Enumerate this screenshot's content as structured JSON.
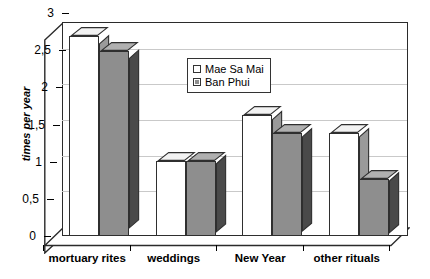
{
  "chart_data": {
    "type": "bar",
    "title": "",
    "subtitle": "",
    "xlabel": "",
    "ylabel": "times per year",
    "categories": [
      "mortuary rites",
      "weddings",
      "New Year",
      "other rituals"
    ],
    "series": [
      {
        "name": "Mae Sa Mai",
        "values": [
          2.8,
          1.05,
          1.7,
          1.45
        ],
        "color": "#ffffff"
      },
      {
        "name": "Ban Phui",
        "values": [
          2.6,
          1.05,
          1.45,
          0.8
        ],
        "color": "#8e8e8e"
      }
    ],
    "ylim": [
      0,
      3
    ],
    "ytick_values": [
      0,
      0.5,
      1,
      1.5,
      2,
      2.5,
      3
    ],
    "ytick_labels": [
      "0",
      "0,5",
      "1",
      "1,5",
      "2",
      "2,5",
      "3"
    ],
    "decimal_separator": ",",
    "grid": true,
    "grid_axis": "y",
    "grid_color": "#c9c9c9",
    "legend_position": "upper center",
    "three_d": true,
    "background_color": "#ffffff",
    "axis_color": "#2b2b2b"
  },
  "axis": {
    "y_title": "times per year",
    "ticks": [
      {
        "label": "3",
        "value": 3
      },
      {
        "label": "2,5",
        "value": 2.5
      },
      {
        "label": "2",
        "value": 2
      },
      {
        "label": "1,5",
        "value": 1.5
      },
      {
        "label": "1",
        "value": 1
      },
      {
        "label": "0,5",
        "value": 0.5
      },
      {
        "label": "0",
        "value": 0
      }
    ]
  },
  "categories": [
    {
      "label": "mortuary rites"
    },
    {
      "label": "weddings"
    },
    {
      "label": "New Year"
    },
    {
      "label": "other rituals"
    }
  ],
  "legend": {
    "items": [
      {
        "label": "Mae Sa Mai",
        "series": "a"
      },
      {
        "label": "Ban Phui",
        "series": "b"
      }
    ]
  }
}
